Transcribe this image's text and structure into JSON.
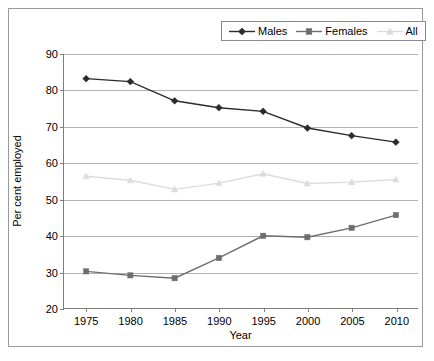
{
  "chart_data": {
    "type": "line",
    "title": "",
    "xlabel": "Year",
    "ylabel": "Per cent employed",
    "categories": [
      1975,
      1980,
      1985,
      1990,
      1995,
      2000,
      2005,
      2010
    ],
    "xtick_labels": [
      "1975",
      "1980",
      "1985",
      "1990",
      "1995",
      "2000",
      "2005",
      "2010"
    ],
    "ytick_labels": [
      "20",
      "30",
      "40",
      "50",
      "60",
      "70",
      "80",
      "90"
    ],
    "ylim": [
      20,
      90
    ],
    "ytick_step": 10,
    "grid": "horizontal",
    "legend_position": "top-right",
    "series": [
      {
        "name": "Males",
        "marker": "diamond",
        "color": "#2b2b2b",
        "values": [
          83.2,
          82.4,
          77.1,
          75.2,
          74.2,
          69.6,
          67.5,
          65.7
        ]
      },
      {
        "name": "Females",
        "marker": "square",
        "color": "#6e6e6e",
        "values": [
          30.1,
          29.0,
          28.2,
          33.8,
          39.9,
          39.5,
          42.1,
          45.6
        ]
      },
      {
        "name": "All",
        "marker": "triangle",
        "color": "#dcdcdc",
        "values": [
          56.3,
          55.2,
          52.7,
          54.4,
          57.0,
          54.3,
          54.7,
          55.4
        ]
      }
    ]
  },
  "legend": {
    "items": [
      {
        "label": "Males"
      },
      {
        "label": "Females"
      },
      {
        "label": "All"
      }
    ]
  }
}
